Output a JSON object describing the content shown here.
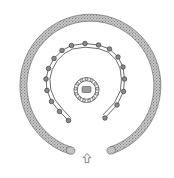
{
  "figure": {
    "kind": "archaeological-site-plan",
    "background_color": "#ffffff",
    "width": 174,
    "height": 178
  },
  "outer_bank": {
    "label": "outer bank ring",
    "fill_color": "#b4b4b4",
    "stroke_color": "#6f6f6f",
    "texture": "stipple",
    "center_x": 86,
    "center_y": 84,
    "radius_x": 70,
    "radius_y": 71,
    "band_width": 7.5,
    "gap_start_deg": 68,
    "gap_end_deg": 112,
    "opening_direction": "south"
  },
  "post_ring": {
    "label": "horseshoe post ring",
    "stroke_color": "#3a3a3a",
    "post_fill": "#8a8a8a",
    "post_stroke": "#2b2b2b",
    "post_count": 18,
    "opening_direction": "south",
    "posts": [
      {
        "id": "p1",
        "x": 98.5,
        "y": 45.0,
        "r": 2.3
      },
      {
        "id": "p2",
        "x": 85.0,
        "y": 43.5,
        "r": 2.3
      },
      {
        "id": "p3",
        "x": 71.5,
        "y": 45.5,
        "r": 2.3
      },
      {
        "id": "p4",
        "x": 62.0,
        "y": 50.5,
        "r": 2.3
      },
      {
        "id": "p5",
        "x": 54.0,
        "y": 58.5,
        "r": 2.3
      },
      {
        "id": "p6",
        "x": 48.5,
        "y": 68.5,
        "r": 2.3
      },
      {
        "id": "p7",
        "x": 46.0,
        "y": 79.0,
        "r": 2.3
      },
      {
        "id": "p8",
        "x": 47.0,
        "y": 90.5,
        "r": 2.3
      },
      {
        "id": "p9",
        "x": 51.5,
        "y": 101.5,
        "r": 2.3
      },
      {
        "id": "p10",
        "x": 59.5,
        "y": 111.5,
        "r": 2.3
      },
      {
        "id": "p11",
        "x": 68.5,
        "y": 120.5,
        "r": 2.3
      },
      {
        "id": "p12",
        "x": 109.5,
        "y": 49.0,
        "r": 2.3
      },
      {
        "id": "p13",
        "x": 118.0,
        "y": 57.0,
        "r": 2.3
      },
      {
        "id": "p14",
        "x": 123.0,
        "y": 67.0,
        "r": 2.3
      },
      {
        "id": "p15",
        "x": 124.5,
        "y": 79.0,
        "r": 2.3
      },
      {
        "id": "p16",
        "x": 123.5,
        "y": 91.5,
        "r": 2.3
      },
      {
        "id": "p17",
        "x": 117.0,
        "y": 105.0,
        "r": 2.3
      },
      {
        "id": "p18",
        "x": 105.0,
        "y": 118.0,
        "r": 2.3
      }
    ],
    "arc_left": "M 98.5 45.0 L 85.0 43.5 L 71.5 45.5 L 62.0 50.5 L 54.0 58.5 L 48.5 68.5 L 46.0 79.0 L 47.0 90.5 L 51.5 101.5 L 59.5 111.5 L 68.5 120.5",
    "arc_right": "M 98.5 45.0 L 109.5 49.0 L 118.0 57.0 L 123.0 67.0 L 124.5 79.0 L 123.5 91.5 L 117.0 105.0 L 105.0 118.0",
    "arc_left_inner": "M 98.0 48.6 L 85.2 47.2 L 72.6 49.0 L 64.2 53.6 L 57.2 60.6 L 52.2 69.6 L 49.9 79.1 L 50.8 89.6 L 55.0 99.8 L 62.6 109.2 L 70.5 117.5",
    "arc_right_inner": "M 98.6 48.6 L 108.4 52.3 L 115.8 59.4 L 120.1 68.4 L 121.4 79.1 L 120.5 90.4 L 114.6 102.5 L 103.3 114.6"
  },
  "center_circle": {
    "label": "central post circle",
    "center_x": 86.5,
    "center_y": 90.0,
    "radius": 12.5,
    "post_count": 13,
    "post_radius": 1.5,
    "post_fill": "#d8d8d8",
    "post_stroke": "#2f2f2f",
    "ring_stroke": "#3a3a3a"
  },
  "center_feature": {
    "label": "central pit",
    "x": 82.0,
    "y": 86.5,
    "width": 9.0,
    "height": 6.0,
    "fill_color": "#9d9d9d"
  },
  "entrance_marker": {
    "label": "entrance arrow",
    "direction": "up",
    "x": 87.0,
    "y": 160.0,
    "fill_color": "#f2f2f2",
    "stroke_color": "#5a5a5a"
  }
}
